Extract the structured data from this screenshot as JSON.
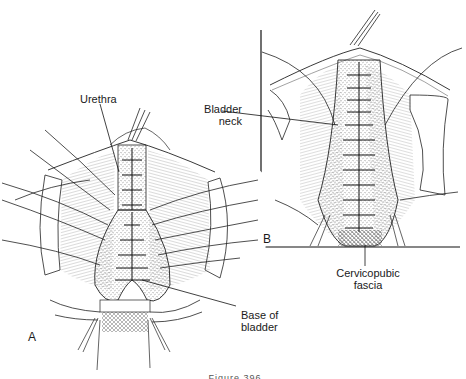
{
  "figure": {
    "caption": "Figure 396",
    "panels": [
      {
        "letter": "A",
        "description": "Anterior vaginal wall opened; urethra and bladder base plicated with interrupted sutures, vaginal flaps retracted"
      },
      {
        "letter": "B",
        "description": "Closer view: plication continued past bladder neck over cervicopubic fascia"
      }
    ],
    "labels": {
      "urethra": "Urethra",
      "bladder_neck_line1": "Bladder",
      "bladder_neck_line2": "neck",
      "cervicopubic_line1": "Cervicopubic",
      "cervicopubic_line2": "fascia",
      "base_line1": "Base of",
      "base_line2": "bladder"
    },
    "colors": {
      "ink": "#1a1a1a",
      "paper": "#ffffff"
    }
  }
}
